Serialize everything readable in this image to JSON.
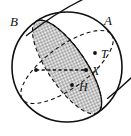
{
  "figure": {
    "kind": "geometry-diagram",
    "background_color": "#ffffff",
    "stroke_color": "#111111",
    "shade_fill_color": "#9a9a9a",
    "shade_pattern": "checkerboard-halftone",
    "sphere": {
      "center_x": 67,
      "center_y": 67,
      "radius": 55,
      "outline_style": "solid"
    },
    "great_circles": [
      {
        "name": "circle-through-B",
        "rotation_deg": -36,
        "semi_major": 55,
        "semi_minor": 21,
        "front_style": "solid",
        "back_style": "dashed",
        "shaded": false
      },
      {
        "name": "circle-through-A",
        "rotation_deg": 56,
        "semi_major": 55,
        "semi_minor": 19,
        "front_style": "solid",
        "back_style": "dashed",
        "shaded": true
      }
    ],
    "chord": {
      "name": "dashed-chord-to-X",
      "style": "dashed",
      "x1": 36,
      "y1": 70,
      "x2": 86,
      "y2": 70
    },
    "points": [
      {
        "id": "B",
        "label": "B",
        "x": 30,
        "y": 27,
        "label_x": 10,
        "label_y": 15,
        "marker": false,
        "size": "big"
      },
      {
        "id": "A",
        "label": "A",
        "x": 104,
        "y": 27,
        "label_x": 104,
        "label_y": 14,
        "marker": false,
        "size": "big"
      },
      {
        "id": "T",
        "label": "T",
        "x": 95,
        "y": 53,
        "label_x": 101,
        "label_y": 48,
        "marker": true,
        "size": "mid"
      },
      {
        "id": "X",
        "label": "X",
        "x": 86,
        "y": 70,
        "label_x": 92,
        "label_y": 65,
        "marker": true,
        "size": "mid"
      },
      {
        "id": "H",
        "label": "H",
        "x": 72,
        "y": 85,
        "label_x": 79,
        "label_y": 81,
        "marker": true,
        "size": "mid"
      }
    ]
  }
}
